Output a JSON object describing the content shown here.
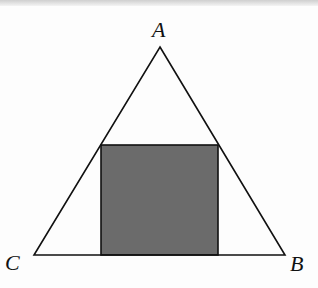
{
  "figure": {
    "vertices": {
      "A": {
        "label": "A",
        "x": 160,
        "y": 47
      },
      "B": {
        "label": "B",
        "x": 285,
        "y": 255
      },
      "C": {
        "label": "C",
        "x": 34,
        "y": 255
      }
    },
    "square": {
      "x": 101,
      "y": 145,
      "width": 117,
      "height": 110,
      "fill": "#6b6b6b"
    },
    "colors": {
      "stroke": "#111111",
      "background": "#fdfdfd"
    }
  }
}
